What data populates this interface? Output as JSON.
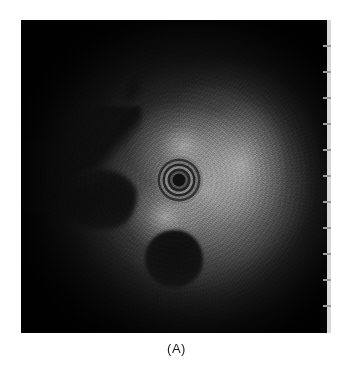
{
  "figure": {
    "caption": "(A)",
    "panel_label": "A",
    "modality": "intravascular-ultrasound-cross-section",
    "background_color": "#ffffff"
  },
  "image_panel": {
    "alt_text": "Grayscale intravascular ultrasound cross-sectional image",
    "left": 21,
    "top": 20,
    "width": 306,
    "height": 313,
    "background_color": "#0b0b0b",
    "brightest_tone": "#cdcdcd",
    "darkest_tone": "#0a0a0a"
  },
  "features": [
    {
      "name": "catheter-ring-artifact",
      "label": "catheter",
      "center_x": 158,
      "center_y": 160,
      "radius": 24,
      "ring_count": 8
    },
    {
      "name": "anechoic-region-lower",
      "label": "side branch lumen",
      "center_x": 153,
      "center_y": 239,
      "radius": 29
    },
    {
      "name": "anechoic-region-left-arm",
      "label": "diagonal branch",
      "center_x": 72,
      "center_y": 132
    },
    {
      "name": "anechoic-region-left-head",
      "label": "branch bulb",
      "center_x": 77,
      "center_y": 179
    },
    {
      "name": "dark-streak-upper",
      "label": "upper hypoechoic streak",
      "center_x": 111,
      "center_y": 67
    }
  ],
  "scale_bar": {
    "name": "depth-scale",
    "orientation": "vertical",
    "position": "right-edge",
    "color": "#d8d8d8",
    "tick_color": "#9a9a9a",
    "tick_count": 11,
    "tick_spacing_px": 26,
    "first_tick_offset_px": 25,
    "top": 20,
    "height": 313
  }
}
